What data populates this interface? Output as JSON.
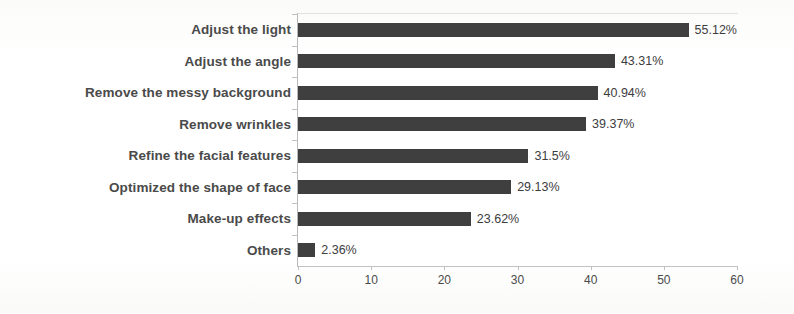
{
  "chart_data": {
    "type": "bar",
    "orientation": "horizontal",
    "title": "",
    "subtitle": "",
    "xlabel": "",
    "ylabel": "",
    "xlim": [
      0,
      60
    ],
    "xticks": [
      0,
      10,
      20,
      30,
      40,
      50,
      60
    ],
    "grid": false,
    "legend": null,
    "bar_color": "#3f3f3f",
    "label_color": "#4a4a4a",
    "value_suffix": "%",
    "categories": [
      "Adjust the light",
      "Adjust the angle",
      "Remove the messy background",
      "Remove wrinkles",
      "Refine the facial features",
      "Optimized the shape of face",
      "Make-up effects",
      "Others"
    ],
    "values": [
      55.12,
      43.31,
      40.94,
      39.37,
      31.5,
      29.13,
      23.62,
      2.36
    ],
    "value_labels": [
      "55.12%",
      "43.31%",
      "40.94%",
      "39.37%",
      "31.5%",
      "29.13%",
      "23.62%",
      "2.36%"
    ]
  }
}
